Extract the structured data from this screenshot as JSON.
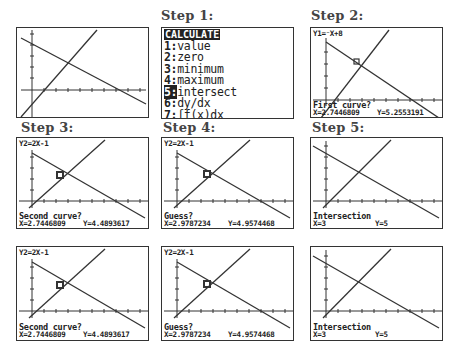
{
  "steps": {
    "step1_label": "Step 1:",
    "step2_label": "Step 2:",
    "step3_label": "Step 3:",
    "step4_label": "Step 4:",
    "step5_label": "Step 5:"
  },
  "menu": {
    "title": "CALCULATE",
    "items": [
      {
        "num": "1:",
        "label": "value"
      },
      {
        "num": "2:",
        "label": "zero"
      },
      {
        "num": "3:",
        "label": "minimum"
      },
      {
        "num": "4:",
        "label": "maximum"
      },
      {
        "num": "5:",
        "label": "intersect",
        "selected": true
      },
      {
        "num": "6:",
        "label": "dy/dx"
      },
      {
        "num": "7:",
        "label": "∫f(x)dx"
      }
    ]
  },
  "graph": {
    "window": {
      "xmin": -1,
      "xmax": 10,
      "ymin": -2,
      "ymax": 9
    },
    "equations": {
      "y1": "Y1=⁻X+8",
      "y2": "Y2=2X-1"
    },
    "intersection": {
      "x": 3,
      "y": 5
    }
  },
  "screens": {
    "step2": {
      "eq": "Y1=⁻X+8",
      "prompt": "First curve?",
      "x": "X=2.7446809",
      "y": "Y=5.2553191"
    },
    "step3": {
      "eq": "Y2=2X-1",
      "prompt": "Second curve?",
      "x": "X=2.7446809",
      "y": "Y=4.4893617"
    },
    "step4": {
      "eq": "Y2=2X-1",
      "prompt": "Guess?",
      "x": "X=2.9787234",
      "y": "Y=4.9574468"
    },
    "step5": {
      "eq": "",
      "prompt": "Intersection",
      "x": "X=3",
      "y": "Y=5"
    }
  }
}
